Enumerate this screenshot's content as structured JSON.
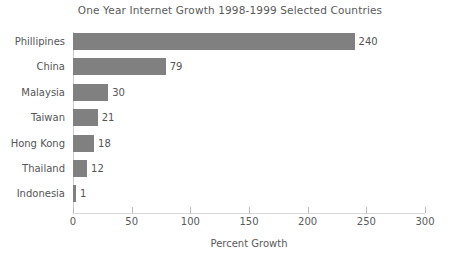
{
  "chart_data": {
    "type": "bar",
    "orientation": "horizontal",
    "title": "One Year Internet Growth 1998-1999 Selected Countries",
    "xlabel": "Percent Growth",
    "ylabel": "",
    "xlim": [
      0,
      300
    ],
    "xticks": [
      0,
      50,
      100,
      150,
      200,
      250,
      300
    ],
    "xtick_labels": [
      "0",
      "50",
      "100",
      "150",
      "200",
      "250",
      "300"
    ],
    "grid": false,
    "legend": false,
    "bar_color": "#808080",
    "text_color": "#555555",
    "background_color": "#ffffff",
    "categories": [
      "Phillipines",
      "China",
      "Malaysia",
      "Taiwan",
      "Hong Kong",
      "Thailand",
      "Indonesia"
    ],
    "values": [
      240,
      79,
      30,
      21,
      18,
      12,
      1
    ],
    "value_labels": [
      "240",
      "79",
      "30",
      "21",
      "18",
      "12",
      "1"
    ]
  }
}
